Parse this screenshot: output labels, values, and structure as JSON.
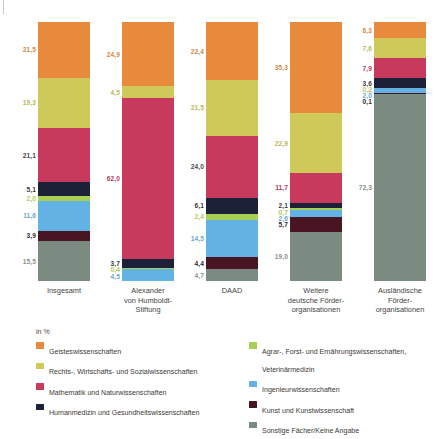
{
  "chart_data": {
    "type": "bar",
    "subtype": "stacked-bar-100-percent",
    "title": "",
    "xlabel": "",
    "ylabel": "",
    "unit_label": "in %",
    "ylim": [
      0,
      100
    ],
    "grid": false,
    "legend_position": "bottom",
    "stack_order_bottom_to_top": [
      "Sonstige Fächer/Keine Angabe",
      "Kunst und Kunstwissenschaft",
      "Ingenieurwissenschaften",
      "Agrar-, Forst- und Ernährungswissenschaften, Veterinärmedizin",
      "Humanmedizin und Gesundheitswissenschaften",
      "Mathematik und Naturwissenschaften",
      "Rechts-, Wirtschafts- und Sozialwissenschaften",
      "Geisteswissenschaften"
    ],
    "categories": [
      "Insgesamt",
      "Alexander von Humboldt-Stiftung",
      "DAAD",
      "Weitere deutsche Förderorganisationen",
      "Ausländische Förderorganisationen"
    ],
    "series": [
      {
        "name": "Geisteswissenschaften",
        "color": "#e8893c",
        "values": [
          21.5,
          24.9,
          22.4,
          35.3,
          6.3
        ]
      },
      {
        "name": "Rechts-, Wirtschafts- und Sozialwissenschaften",
        "color": "#cfc95a",
        "values": [
          19.3,
          4.5,
          21.5,
          22.9,
          7.6
        ]
      },
      {
        "name": "Mathematik und Naturwissenschaften",
        "color": "#c73a5e",
        "values": [
          21.1,
          62.0,
          24.0,
          11.7,
          7.9
        ]
      },
      {
        "name": "Humanmedizin und Gesundheitswissenschaften",
        "color": "#1d2138",
        "values": [
          5.1,
          3.7,
          6.1,
          2.1,
          3.6
        ]
      },
      {
        "name": "Agrar-, Forst- und Ernährungswissenschaften, Veterinärmedizin",
        "color": "#a9ce54",
        "values": [
          2.0,
          0.4,
          2.4,
          0.7,
          0.2
        ]
      },
      {
        "name": "Ingenieurwissenschaften",
        "color": "#63b2e4",
        "values": [
          11.6,
          4.5,
          14.5,
          2.6,
          2.0
        ]
      },
      {
        "name": "Kunst und Kunstwissenschaft",
        "color": "#4a1522",
        "values": [
          3.9,
          0.0,
          4.4,
          5.7,
          0.1
        ]
      },
      {
        "name": "Sonstige Fächer/Keine Angabe",
        "color": "#7c8b82",
        "values": [
          15.5,
          0.0,
          4.7,
          19.0,
          72.3
        ]
      }
    ],
    "bars": [
      {
        "category_label": "Insgesamt",
        "segments": [
          {
            "label": "21,5",
            "value": 21.5,
            "series": "Geisteswissenschaften",
            "color": "#e8893c",
            "label_color": "#cf8a4c"
          },
          {
            "label": "19,3",
            "value": 19.3,
            "series": "Rechts-, Wirtschafts- und Sozialwissenschaften",
            "color": "#cfc95a",
            "label_color": "#bdb659"
          },
          {
            "label": "21,1",
            "value": 21.1,
            "series": "Mathematik und Naturwissenschaften",
            "color": "#c73a5e",
            "label_color": "#4a4a48"
          },
          {
            "label": "5,1",
            "value": 5.1,
            "series": "Humanmedizin und Gesundheitswissenschaften",
            "color": "#1d2138",
            "label_color": "#3a3a42"
          },
          {
            "label": "2,0",
            "value": 2.0,
            "series": "Agrar-, Forst- und Ernährungswissenschaften, Veterinärmedizin",
            "color": "#a9ce54",
            "label_color": "#b0c95c"
          },
          {
            "label": "11,6",
            "value": 11.6,
            "series": "Ingenieurwissenschaften",
            "color": "#63b2e4",
            "label_color": "#6ba6cc"
          },
          {
            "label": "3,9",
            "value": 3.9,
            "series": "Kunst und Kunstwissenschaft",
            "color": "#4a1522",
            "label_color": "#332b2d"
          },
          {
            "label": "15,5",
            "value": 15.5,
            "series": "Sonstige Fächer/Keine Angabe",
            "color": "#7c8b82",
            "label_color": "#8a9189"
          }
        ]
      },
      {
        "category_label": "Alexander von Humboldt-Stiftung",
        "segments": [
          {
            "label": "24,9",
            "value": 24.9,
            "series": "Geisteswissenschaften",
            "color": "#e8893c",
            "label_color": "#cf8a4c"
          },
          {
            "label": "4,5",
            "value": 4.5,
            "series": "Rechts-, Wirtschafts- und Sozialwissenschaften",
            "color": "#cfc95a",
            "label_color": "#bdb659"
          },
          {
            "label": "62,0",
            "value": 62.0,
            "series": "Mathematik und Naturwissenschaften",
            "color": "#c73a5e",
            "label_color": "#b8385c"
          },
          {
            "label": "3,7",
            "value": 3.7,
            "series": "Humanmedizin und Gesundheitswissenschaften",
            "color": "#1d2138",
            "label_color": "#3a3a42"
          },
          {
            "label": "0,4",
            "value": 0.4,
            "series": "Agrar-, Forst- und Ernährungswissenschaften, Veterinärmedizin",
            "color": "#a9ce54",
            "label_color": "#b0c95c"
          },
          {
            "label": "4,5",
            "value": 4.5,
            "series": "Ingenieurwissenschaften",
            "color": "#63b2e4",
            "label_color": "#6ba6cc"
          }
        ]
      },
      {
        "category_label": "DAAD",
        "segments": [
          {
            "label": "22,4",
            "value": 22.4,
            "series": "Geisteswissenschaften",
            "color": "#e8893c",
            "label_color": "#cf8a4c"
          },
          {
            "label": "21,5",
            "value": 21.5,
            "series": "Rechts-, Wirtschafts- und Sozialwissenschaften",
            "color": "#cfc95a",
            "label_color": "#bdb659"
          },
          {
            "label": "24,0",
            "value": 24.0,
            "series": "Mathematik und Naturwissenschaften",
            "color": "#c73a5e",
            "label_color": "#4a4a48"
          },
          {
            "label": "6,1",
            "value": 6.1,
            "series": "Humanmedizin und Gesundheitswissenschaften",
            "color": "#1d2138",
            "label_color": "#3a3a42"
          },
          {
            "label": "2,4",
            "value": 2.4,
            "series": "Agrar-, Forst- und Ernährungswissenschaften, Veterinärmedizin",
            "color": "#a9ce54",
            "label_color": "#b0c95c"
          },
          {
            "label": "14,5",
            "value": 14.5,
            "series": "Ingenieurwissenschaften",
            "color": "#63b2e4",
            "label_color": "#6ba6cc"
          },
          {
            "label": "4,4",
            "value": 4.4,
            "series": "Kunst und Kunstwissenschaft",
            "color": "#4a1522",
            "label_color": "#332b2d"
          },
          {
            "label": "4,7",
            "value": 4.7,
            "series": "Sonstige Fächer/Keine Angabe",
            "color": "#7c8b82",
            "label_color": "#8a9189"
          }
        ]
      },
      {
        "category_label": "Weitere deutsche Förderorganisationen",
        "segments": [
          {
            "label": "35,3",
            "value": 35.3,
            "series": "Geisteswissenschaften",
            "color": "#e8893c",
            "label_color": "#cf8a4c"
          },
          {
            "label": "22,9",
            "value": 22.9,
            "series": "Rechts-, Wirtschafts- und Sozialwissenschaften",
            "color": "#cfc95a",
            "label_color": "#bdb659"
          },
          {
            "label": "11,7",
            "value": 11.7,
            "series": "Mathematik und Naturwissenschaften",
            "color": "#c73a5e",
            "label_color": "#b8385c"
          },
          {
            "label": "2,1",
            "value": 2.1,
            "series": "Humanmedizin und Gesundheitswissenschaften",
            "color": "#1d2138",
            "label_color": "#3a3a42"
          },
          {
            "label": "0,7",
            "value": 0.7,
            "series": "Agrar-, Forst- und Ernährungswissenschaften, Veterinärmedizin",
            "color": "#a9ce54",
            "label_color": "#b0c95c"
          },
          {
            "label": "2,6",
            "value": 2.6,
            "series": "Ingenieurwissenschaften",
            "color": "#63b2e4",
            "label_color": "#6ba6cc"
          },
          {
            "label": "5,7",
            "value": 5.7,
            "series": "Kunst und Kunstwissenschaft",
            "color": "#4a1522",
            "label_color": "#332b2d"
          },
          {
            "label": "19,0",
            "value": 19.0,
            "series": "Sonstige Fächer/Keine Angabe",
            "color": "#7c8b82",
            "label_color": "#8a9189"
          }
        ]
      },
      {
        "category_label": "Ausländische Förderorganisationen",
        "segments": [
          {
            "label": "6,3",
            "value": 6.3,
            "series": "Geisteswissenschaften",
            "color": "#e8893c",
            "label_color": "#cf8a4c"
          },
          {
            "label": "7,6",
            "value": 7.6,
            "series": "Rechts-, Wirtschafts- und Sozialwissenschaften",
            "color": "#cfc95a",
            "label_color": "#bdb659"
          },
          {
            "label": "7,9",
            "value": 7.9,
            "series": "Mathematik und Naturwissenschaften",
            "color": "#c73a5e",
            "label_color": "#b8385c"
          },
          {
            "label": "3,6",
            "value": 3.6,
            "series": "Humanmedizin und Gesundheitswissenschaften",
            "color": "#1d2138",
            "label_color": "#3a3a42"
          },
          {
            "label": "0,2",
            "value": 0.2,
            "series": "Agrar-, Forst- und Ernährungswissenschaften, Veterinärmedizin",
            "color": "#a9ce54",
            "label_color": "#b0c95c"
          },
          {
            "label": "2,0",
            "value": 2.0,
            "series": "Ingenieurwissenschaften",
            "color": "#63b2e4",
            "label_color": "#6ba6cc"
          },
          {
            "label": "0,1",
            "value": 0.1,
            "series": "Kunst und Kunstwissenschaft",
            "color": "#4a1522",
            "label_color": "#332b2d"
          },
          {
            "label": "72,3",
            "value": 72.3,
            "series": "Sonstige Fächer/Keine Angabe",
            "color": "#7c8b82",
            "label_color": "#8a9189"
          }
        ]
      }
    ],
    "legend": {
      "unit": "in %",
      "left_column": [
        {
          "label": "Geisteswissenschaften",
          "color": "#e8893c"
        },
        {
          "label": "Rechts-, Wirtschafts- und Sozialwissenschaften",
          "color": "#cfc95a"
        },
        {
          "label": "Mathematik und Naturwissenschaften",
          "color": "#c73a5e"
        },
        {
          "label": "Humanmedizin und Gesundheitswissenschaften",
          "color": "#1d2138"
        }
      ],
      "right_column": [
        {
          "label": "Agrar-, Forst- und Ernährungswissenschaften,\nVeterinärmedizin",
          "color": "#a9ce54"
        },
        {
          "label": "Ingenieurwissenschaften",
          "color": "#63b2e4"
        },
        {
          "label": "Kunst und Kunstwissenschaft",
          "color": "#4a1522"
        },
        {
          "label": "Sonstige Fächer/Keine Angabe",
          "color": "#7c8b82"
        }
      ]
    },
    "category_captions": [
      "Insgesamt",
      "Alexander\nvon Humboldt-\nStiftung",
      "DAAD",
      "Weitere\ndeutsche Förder-\norganisationen",
      "Ausländische\nFörder-\norganisationen"
    ]
  }
}
